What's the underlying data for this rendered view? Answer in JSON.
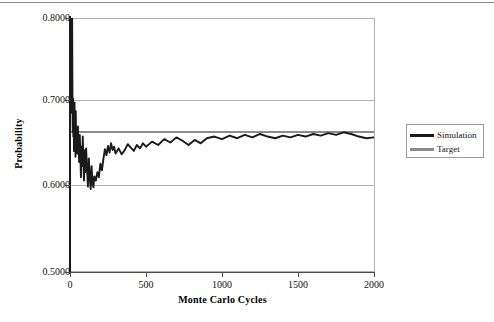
{
  "figure": {
    "top_rule": true,
    "background": "#ffffff"
  },
  "axis": {
    "y_title": "Probability",
    "x_title": "Monte Carlo Cycles",
    "y_ticks": [
      "0.5000",
      "0.6000",
      "0.7000",
      "0.8000"
    ],
    "x_ticks": [
      "0",
      "500",
      "1000",
      "1500",
      "2000"
    ]
  },
  "legend": {
    "items": [
      {
        "label": "Simulation",
        "color": "#1a1a1a"
      },
      {
        "label": "Target",
        "color": "#8c8c8c"
      }
    ]
  },
  "chart_data": {
    "type": "line",
    "title": "",
    "subtitle": "",
    "xlabel": "Monte Carlo Cycles",
    "ylabel": "Probability",
    "xlim": [
      0,
      2000
    ],
    "ylim": [
      0.5,
      0.8
    ],
    "xticks": [
      0,
      500,
      1000,
      1500,
      2000
    ],
    "yticks": [
      0.5,
      0.6,
      0.7,
      0.8
    ],
    "ytick_labels": [
      "0.5000",
      "0.6000",
      "0.7000",
      "0.8000"
    ],
    "grid": "horizontal",
    "legend_position": "right-outside",
    "series": [
      {
        "name": "Target",
        "type": "horizontal-line",
        "color": "#8c8c8c",
        "value": 0.665
      },
      {
        "name": "Simulation",
        "type": "line",
        "color": "#1a1a1a",
        "x": [
          2,
          4,
          6,
          8,
          10,
          12,
          14,
          16,
          18,
          20,
          22,
          24,
          26,
          28,
          30,
          32,
          34,
          36,
          38,
          40,
          44,
          48,
          52,
          56,
          60,
          64,
          68,
          72,
          76,
          80,
          84,
          88,
          92,
          96,
          100,
          106,
          112,
          118,
          124,
          130,
          136,
          142,
          148,
          154,
          160,
          170,
          180,
          190,
          200,
          210,
          220,
          230,
          240,
          250,
          260,
          270,
          280,
          290,
          300,
          320,
          340,
          360,
          380,
          400,
          420,
          440,
          460,
          480,
          500,
          540,
          580,
          620,
          660,
          700,
          740,
          780,
          820,
          860,
          900,
          950,
          1000,
          1050,
          1100,
          1150,
          1200,
          1250,
          1300,
          1350,
          1400,
          1450,
          1500,
          1550,
          1600,
          1650,
          1700,
          1750,
          1800,
          1850,
          1900,
          1950,
          2000
        ],
        "y": [
          0.8,
          0.795,
          0.76,
          0.8,
          0.742,
          0.688,
          0.8,
          0.715,
          0.666,
          0.705,
          0.66,
          0.692,
          0.643,
          0.676,
          0.7,
          0.648,
          0.672,
          0.636,
          0.69,
          0.655,
          0.668,
          0.64,
          0.672,
          0.648,
          0.63,
          0.662,
          0.641,
          0.612,
          0.648,
          0.625,
          0.66,
          0.632,
          0.608,
          0.644,
          0.618,
          0.646,
          0.622,
          0.601,
          0.634,
          0.612,
          0.598,
          0.625,
          0.605,
          0.6,
          0.613,
          0.608,
          0.618,
          0.612,
          0.628,
          0.62,
          0.634,
          0.645,
          0.638,
          0.649,
          0.641,
          0.652,
          0.644,
          0.648,
          0.64,
          0.646,
          0.639,
          0.644,
          0.651,
          0.647,
          0.643,
          0.65,
          0.646,
          0.652,
          0.648,
          0.654,
          0.65,
          0.657,
          0.653,
          0.659,
          0.655,
          0.65,
          0.656,
          0.652,
          0.658,
          0.66,
          0.657,
          0.661,
          0.658,
          0.662,
          0.659,
          0.663,
          0.66,
          0.658,
          0.661,
          0.659,
          0.662,
          0.66,
          0.663,
          0.661,
          0.664,
          0.662,
          0.665,
          0.663,
          0.66,
          0.658,
          0.659
        ]
      }
    ]
  }
}
